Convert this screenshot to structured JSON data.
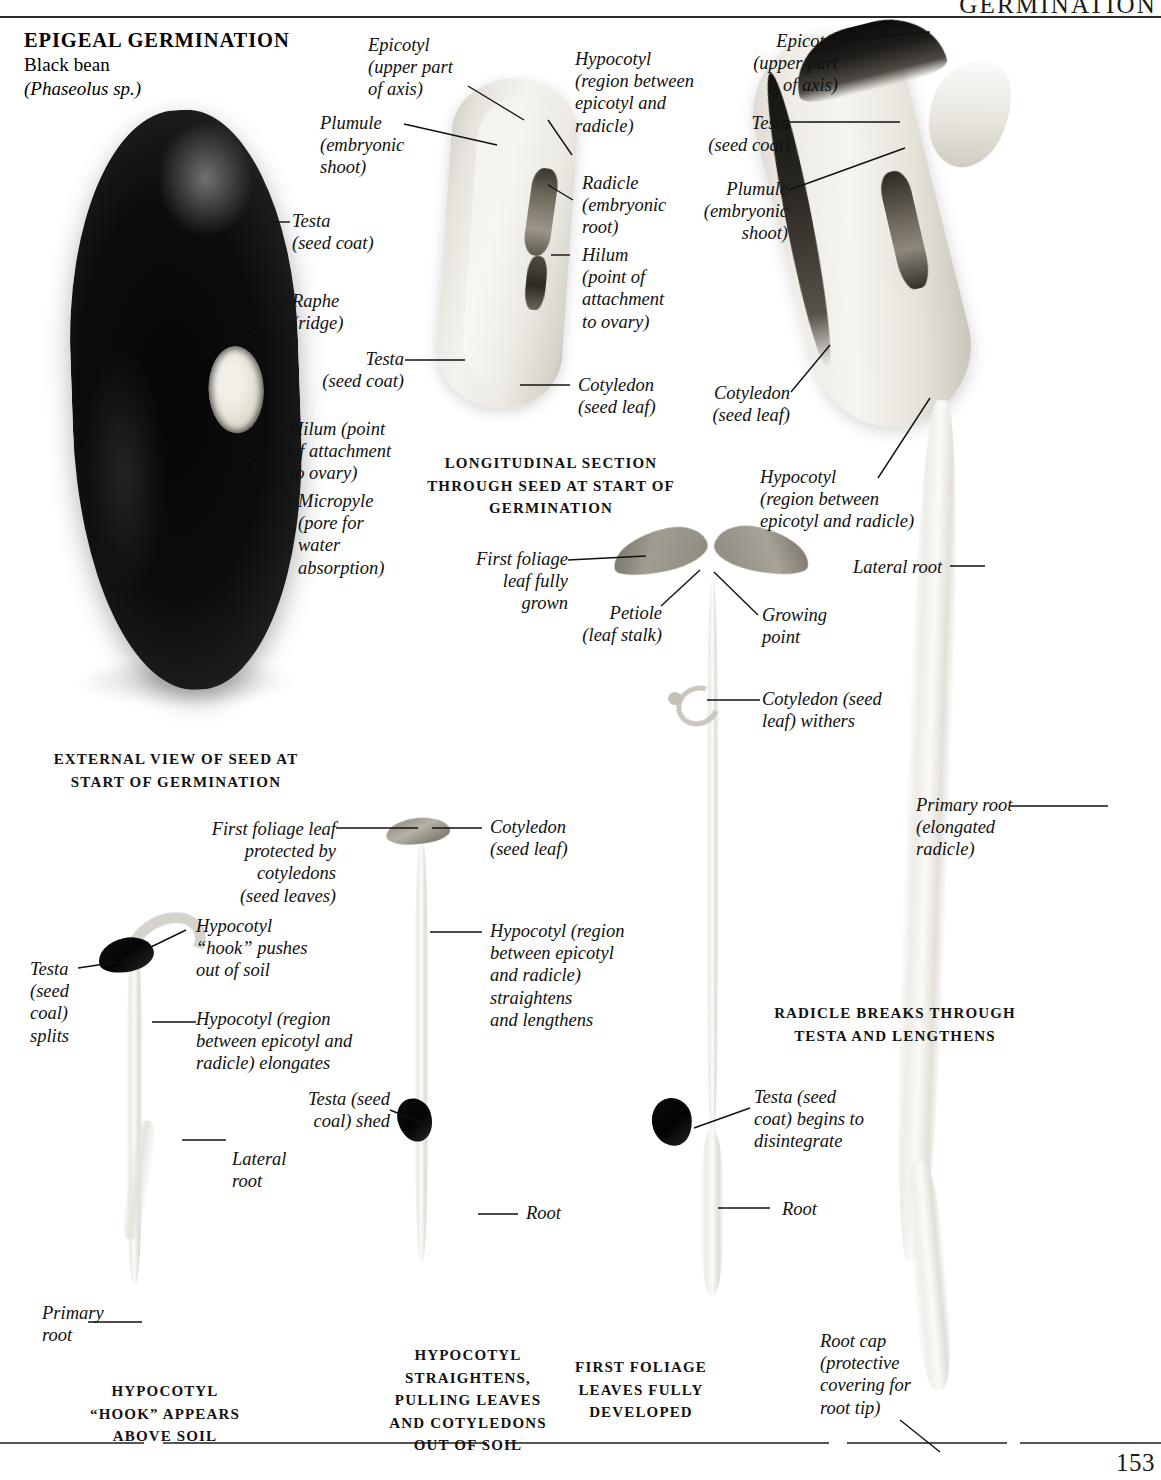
{
  "header": {
    "running_head": "GERMINATION",
    "page_number": "153"
  },
  "title": {
    "main": "EPIGEAL GERMINATION",
    "common_name": "Black bean",
    "scientific_name": "(Phaseolus sp.)"
  },
  "panels": {
    "external_view": {
      "caption": "EXTERNAL VIEW OF SEED AT\nSTART OF GERMINATION",
      "labels": [
        {
          "id": "testa",
          "text": "Testa\n(seed coat)"
        },
        {
          "id": "raphe",
          "text": "Raphe\n(ridge)"
        },
        {
          "id": "hilum",
          "text": "Hilum (point\nof attachment\nto ovary)"
        },
        {
          "id": "micropyle",
          "text": "Micropyle\n(pore for\nwater\nabsorption)"
        }
      ]
    },
    "longitudinal_section": {
      "caption": "LONGITUDINAL SECTION\nTHROUGH SEED AT START OF\nGERMINATION",
      "labels": [
        {
          "id": "epicotyl",
          "text": "Epicotyl\n(upper part\nof axis)"
        },
        {
          "id": "plumule",
          "text": "Plumule\n(embryonic\nshoot)"
        },
        {
          "id": "hypocotyl",
          "text": "Hypocotyl\n(region between\nepicotyl and\nradicle)"
        },
        {
          "id": "radicle",
          "text": "Radicle\n(embryonic\nroot)"
        },
        {
          "id": "hilum",
          "text": "Hilum\n(point of\nattachment\nto ovary)"
        },
        {
          "id": "testa",
          "text": "Testa\n(seed coat)"
        },
        {
          "id": "cotyledon",
          "text": "Cotyledon\n(seed leaf)"
        }
      ]
    },
    "radicle_breaks": {
      "caption": "RADICLE BREAKS THROUGH\nTESTA AND LENGTHENS",
      "labels": [
        {
          "id": "epicotyl",
          "text": "Epicotyl\n(upper part\nof axis)"
        },
        {
          "id": "testa",
          "text": "Testa\n(seed coat)"
        },
        {
          "id": "plumule",
          "text": "Plumule\n(embryonic\nshoot)"
        },
        {
          "id": "cotyledon",
          "text": "Cotyledon\n(seed leaf)"
        },
        {
          "id": "hypocotyl",
          "text": "Hypocotyl\n(region between\nepicotyl and radicle)"
        },
        {
          "id": "lateral-root",
          "text": "Lateral root"
        },
        {
          "id": "primary-root",
          "text": "Primary root\n(elongated\nradicle)"
        },
        {
          "id": "root-cap",
          "text": "Root cap\n(protective\ncovering for\nroot tip)"
        }
      ]
    },
    "hook_appears": {
      "caption": "HYPOCOTYL\n“HOOK” APPEARS\nABOVE SOIL",
      "labels": [
        {
          "id": "testa-splits",
          "text": "Testa\n(seed\ncoal)\nsplits"
        },
        {
          "id": "hypocotyl-hook",
          "text": "Hypocotyl\n“hook” pushes\nout of soil"
        },
        {
          "id": "hypocotyl-elongates",
          "text": "Hypocotyl (region\nbetween epicotyl and\nradicle) elongates"
        },
        {
          "id": "lateral-root",
          "text": "Lateral\nroot"
        },
        {
          "id": "primary-root",
          "text": "Primary\nroot"
        }
      ]
    },
    "hypocotyl_straightens": {
      "caption": "HYPOCOTYL\nSTRAIGHTENS,\nPULLING LEAVES\nAND COTYLEDONS\nOUT OF SOIL",
      "labels": [
        {
          "id": "first-foliage-leaf",
          "text": "First foliage leaf\nprotected by cotyledons\n(seed leaves)"
        },
        {
          "id": "cotyledon",
          "text": "Cotyledon\n(seed leaf)"
        },
        {
          "id": "hypocotyl-straightens",
          "text": "Hypocotyl (region\nbetween epicotyl\nand radicle)\nstraightens\nand lengthens"
        },
        {
          "id": "testa-shed",
          "text": "Testa (seed\ncoal) shed"
        },
        {
          "id": "root",
          "text": "Root"
        }
      ]
    },
    "first_foliage": {
      "caption": "FIRST FOLIAGE\nLEAVES FULLY\nDEVELOPED",
      "labels": [
        {
          "id": "first-foliage-leaf",
          "text": "First foliage\nleaf fully\ngrown"
        },
        {
          "id": "petiole",
          "text": "Petiole\n(leaf  stalk)"
        },
        {
          "id": "growing-point",
          "text": "Growing\npoint"
        },
        {
          "id": "cotyledon-withers",
          "text": "Cotyledon (seed\nleaf) withers"
        },
        {
          "id": "testa-disintegrates",
          "text": "Testa (seed\ncoat) begins to\ndisintegrate"
        },
        {
          "id": "root",
          "text": "Root"
        }
      ]
    }
  }
}
